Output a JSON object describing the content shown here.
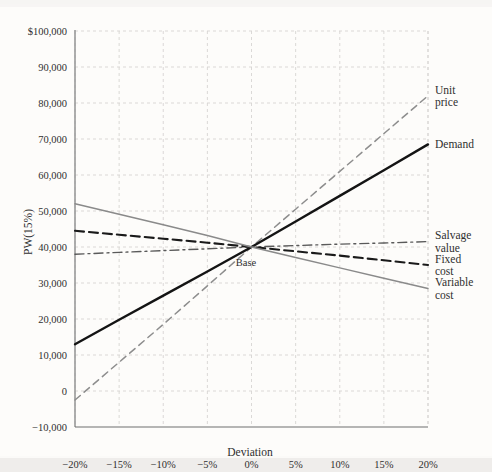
{
  "chart_data": {
    "type": "line",
    "title": "",
    "subtitle": "",
    "xlabel": "Deviation",
    "ylabel": "PW(15%)",
    "x": [
      -20,
      -15,
      -10,
      -5,
      0,
      5,
      10,
      15,
      20
    ],
    "x_tick_labels": [
      "−20%",
      "−15%",
      "−10%",
      "−5%",
      "0%",
      "5%",
      "10%",
      "15%",
      "20%"
    ],
    "y_tick_labels": [
      "$100,000",
      "90,000",
      "80,000",
      "70,000",
      "60,000",
      "50,000",
      "40,000",
      "30,000",
      "20,000",
      "10,000",
      "0",
      "−10,000"
    ],
    "y_ticks": [
      100000,
      90000,
      80000,
      70000,
      60000,
      50000,
      40000,
      30000,
      20000,
      10000,
      0,
      -10000
    ],
    "xlim": [
      -20,
      20
    ],
    "ylim": [
      -10000,
      100000
    ],
    "grid": true,
    "legend_position": "right-inline-labels",
    "base_point": {
      "x": 0,
      "y": 40000,
      "label": "Base"
    },
    "series": [
      {
        "name": "Unit price",
        "label_lines": [
          "Unit",
          "price"
        ],
        "style": "dashed",
        "color": "#8d8d8d",
        "width": 1.5,
        "values": [
          -2500,
          8000,
          18500,
          29200,
          40000,
          50500,
          61000,
          71500,
          82000
        ]
      },
      {
        "name": "Demand",
        "label_lines": [
          "Demand"
        ],
        "style": "solid",
        "color": "#141414",
        "width": 2.4,
        "values": [
          13000,
          19800,
          26500,
          33200,
          40000,
          47100,
          54200,
          61300,
          68500
        ]
      },
      {
        "name": "Salvage value",
        "label_lines": [
          "Salvage",
          "value"
        ],
        "style": "dashdot",
        "color": "#5a5a5a",
        "width": 1.4,
        "values": [
          38000,
          38500,
          39000,
          39500,
          40000,
          40400,
          40800,
          41100,
          41500
        ]
      },
      {
        "name": "Fixed cost",
        "label_lines": [
          "Fixed",
          "cost"
        ],
        "style": "dashed-heavy",
        "color": "#1a1a1a",
        "width": 2.1,
        "values": [
          44500,
          43400,
          42300,
          41200,
          40000,
          38800,
          37600,
          36300,
          35000
        ]
      },
      {
        "name": "Variable cost",
        "label_lines": [
          "Variable",
          "cost"
        ],
        "style": "solid",
        "color": "#8a8a8a",
        "width": 1.5,
        "values": [
          52000,
          49100,
          46200,
          43200,
          40000,
          37100,
          34200,
          31300,
          28500
        ]
      }
    ]
  },
  "axis": {
    "x_title": "Deviation",
    "y_title": "PW(15%)"
  }
}
